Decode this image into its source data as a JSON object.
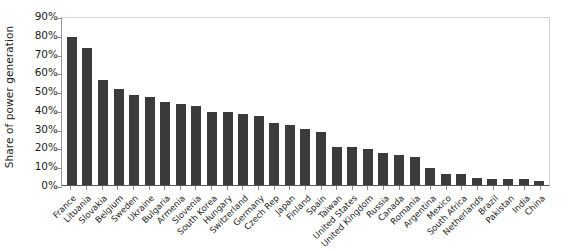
{
  "chart_data": {
    "type": "bar",
    "title": "",
    "subtitle": "",
    "xlabel": "",
    "ylabel": "Share of power generation",
    "ylim": [
      0,
      90
    ],
    "ytick_step": 10,
    "ytick_labels": [
      "90%",
      "80%",
      "70%",
      "60%",
      "50%",
      "40%",
      "30%",
      "20%",
      "10%",
      "0%"
    ],
    "yticks": [
      90,
      80,
      70,
      60,
      50,
      40,
      30,
      20,
      10,
      0
    ],
    "grid": false,
    "legend": null,
    "bar_color": "#3b3b3b",
    "axis_color": "#5a5a5a",
    "categories": [
      "France",
      "Lituania",
      "Slovakia",
      "Belgium",
      "Sweden",
      "Ukraine",
      "Bulgaria",
      "Armenia",
      "Slovenia",
      "South Korea",
      "Hungary",
      "Switzerland",
      "Germany",
      "Czech Rep",
      "Japan",
      "Finland",
      "Spain",
      "Taiwan",
      "United States",
      "United Kingdom",
      "Russia",
      "Canada",
      "Romania",
      "Argentina",
      "Mexico",
      "South Africa",
      "Netherlands",
      "Brazil",
      "Pakistan",
      "India",
      "China"
    ],
    "values": [
      79,
      73,
      56,
      51,
      48,
      47,
      44,
      43,
      42,
      39,
      39,
      38,
      37,
      33,
      32,
      30,
      28,
      20,
      20,
      19,
      17,
      16,
      15,
      9,
      6,
      6,
      4,
      3,
      3,
      3,
      2
    ],
    "value_labels": [
      "79%",
      "73%",
      "56%",
      "51%",
      "48%",
      "47%",
      "44%",
      "43%",
      "42%",
      "39%",
      "39%",
      "38%",
      "37%",
      "33%",
      "32%",
      "30%",
      "28%",
      "20%",
      "20%",
      "19%",
      "17%",
      "16%",
      "15%",
      "9%",
      "6%",
      "6%",
      "4%",
      "3%",
      "3%",
      "3%",
      "2%"
    ]
  }
}
